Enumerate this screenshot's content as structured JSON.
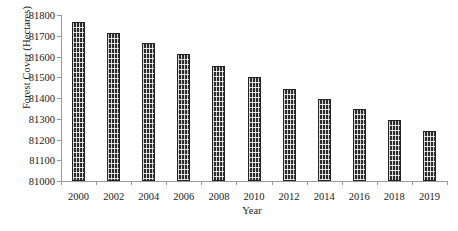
{
  "chart_data": {
    "type": "bar",
    "title": "",
    "xlabel": "Year",
    "ylabel": "Forest Cover (Hectares)",
    "categories": [
      "2000",
      "2002",
      "2004",
      "2006",
      "2008",
      "2010",
      "2012",
      "2014",
      "2016",
      "2018",
      "2019"
    ],
    "values": [
      81765,
      81715,
      81665,
      81610,
      81555,
      81500,
      81445,
      81395,
      81345,
      81293,
      81241
    ],
    "series": [
      {
        "name": "Forest Cover",
        "values": [
          81765,
          81715,
          81665,
          81610,
          81555,
          81500,
          81445,
          81395,
          81345,
          81293,
          81241
        ]
      }
    ],
    "ylim": [
      81000,
      81800
    ],
    "yticks": [
      81000,
      81100,
      81200,
      81300,
      81400,
      81500,
      81600,
      81700,
      81800
    ],
    "ytick_labels": [
      "81000",
      "81100",
      "81200",
      "81300",
      "81400",
      "81500",
      "81600",
      "81700",
      "81800"
    ],
    "grid": false,
    "legend": null,
    "bar_color": "#2b2b2b",
    "bar_pattern": "brick",
    "axis_color": "#9a9a9a"
  }
}
